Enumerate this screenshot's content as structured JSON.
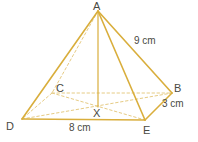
{
  "figure": {
    "shape": "rectangular-based pyramid",
    "stroke_color": "#d9ae3c",
    "dashed_color": "#e6cb84",
    "label_color": "#4a4a42",
    "background_color": "#ffffff",
    "vertices": {
      "apex": {
        "id": "A",
        "label": "A",
        "x": 98,
        "y": 11
      },
      "back_right": {
        "id": "B",
        "label": "B",
        "x": 172,
        "y": 93
      },
      "back_left": {
        "id": "C",
        "label": "C",
        "x": 52,
        "y": 93
      },
      "front_left": {
        "id": "D",
        "label": "D",
        "x": 22,
        "y": 119
      },
      "front_right": {
        "id": "E",
        "label": "E",
        "x": 145,
        "y": 120
      },
      "center": {
        "id": "X",
        "label": "X",
        "x": 98,
        "y": 106
      }
    },
    "measurements": [
      {
        "name": "slant-edge-AB",
        "label": "9 cm",
        "value": 9,
        "unit": "cm",
        "edge": "A-B"
      },
      {
        "name": "base-edge-BE",
        "label": "3 cm",
        "value": 3,
        "unit": "cm",
        "edge": "B-E"
      },
      {
        "name": "base-edge-DE",
        "label": "8 cm",
        "value": 8,
        "unit": "cm",
        "edge": "D-E"
      }
    ],
    "solid_edges": [
      "A-D",
      "A-B",
      "A-E",
      "A-X",
      "D-E",
      "E-B"
    ],
    "dashed_edges": [
      "A-C",
      "C-D",
      "C-B",
      "D-B",
      "C-E",
      "D-X",
      "B-X",
      "C-X",
      "E-X"
    ]
  }
}
